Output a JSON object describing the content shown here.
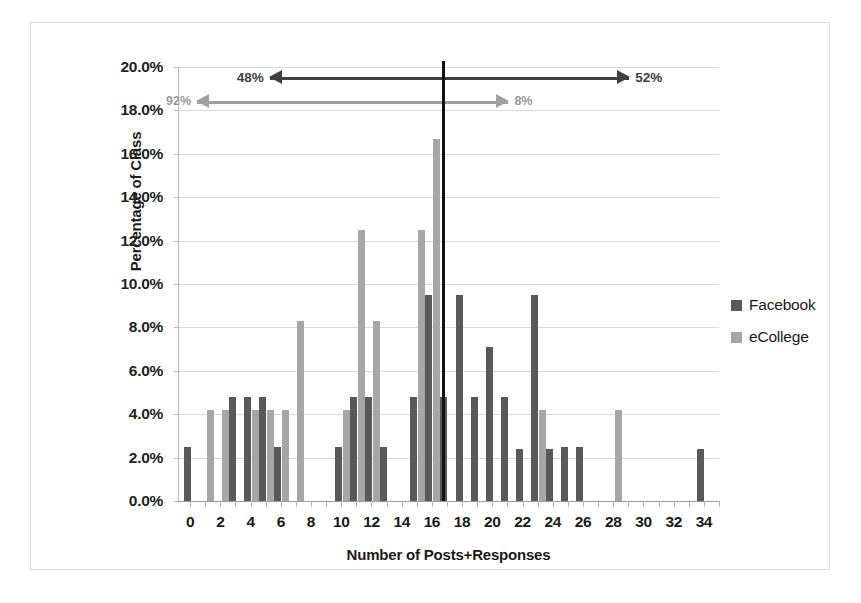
{
  "chart_data": {
    "type": "bar",
    "title": "",
    "xlabel": "Number of Posts+Responses",
    "ylabel": "Percentage of Class",
    "xlim": [
      -0.8,
      35
    ],
    "ylim": [
      0,
      20
    ],
    "ytick_labels": [
      "0.0%",
      "2.0%",
      "4.0%",
      "6.0%",
      "8.0%",
      "10.0%",
      "12.0%",
      "14.0%",
      "16.0%",
      "18.0%",
      "20.0%"
    ],
    "ytick_values": [
      0,
      2,
      4,
      6,
      8,
      10,
      12,
      14,
      16,
      18,
      20
    ],
    "xtick_labels": [
      "0",
      "2",
      "4",
      "6",
      "8",
      "10",
      "12",
      "14",
      "16",
      "18",
      "20",
      "22",
      "24",
      "26",
      "28",
      "30",
      "32",
      "34"
    ],
    "xtick_values": [
      0,
      2,
      4,
      6,
      8,
      10,
      12,
      14,
      16,
      18,
      20,
      22,
      24,
      26,
      28,
      30,
      32,
      34
    ],
    "grid": true,
    "legend_position": "right",
    "colors": {
      "facebook": "#595959",
      "ecollege": "#a6a6a6",
      "median_line": "#111111",
      "gridline": "#d9d9d9"
    },
    "series": [
      {
        "name": "Facebook",
        "color": "#595959",
        "points": [
          {
            "x": 0,
            "y": 2.5
          },
          {
            "x": 3,
            "y": 4.8
          },
          {
            "x": 4,
            "y": 4.8
          },
          {
            "x": 5,
            "y": 4.8
          },
          {
            "x": 6,
            "y": 2.5
          },
          {
            "x": 10,
            "y": 2.5
          },
          {
            "x": 11,
            "y": 4.8
          },
          {
            "x": 12,
            "y": 4.8
          },
          {
            "x": 13,
            "y": 2.5
          },
          {
            "x": 15,
            "y": 4.8
          },
          {
            "x": 16,
            "y": 9.5
          },
          {
            "x": 17,
            "y": 4.8
          },
          {
            "x": 18,
            "y": 9.5
          },
          {
            "x": 19,
            "y": 4.8
          },
          {
            "x": 20,
            "y": 7.1
          },
          {
            "x": 21,
            "y": 4.8
          },
          {
            "x": 22,
            "y": 2.4
          },
          {
            "x": 23,
            "y": 9.5
          },
          {
            "x": 24,
            "y": 2.4
          },
          {
            "x": 25,
            "y": 2.5
          },
          {
            "x": 26,
            "y": 2.5
          },
          {
            "x": 34,
            "y": 2.4
          }
        ]
      },
      {
        "name": "eCollege",
        "color": "#a6a6a6",
        "points": [
          {
            "x": 1,
            "y": 4.2
          },
          {
            "x": 2,
            "y": 4.2
          },
          {
            "x": 4,
            "y": 4.2
          },
          {
            "x": 5,
            "y": 4.2
          },
          {
            "x": 6,
            "y": 4.2
          },
          {
            "x": 7,
            "y": 8.3
          },
          {
            "x": 10,
            "y": 4.2
          },
          {
            "x": 11,
            "y": 12.5
          },
          {
            "x": 12,
            "y": 8.3
          },
          {
            "x": 15,
            "y": 12.5
          },
          {
            "x": 16,
            "y": 16.7
          },
          {
            "x": 23,
            "y": 4.2
          },
          {
            "x": 28,
            "y": 4.2
          }
        ]
      }
    ],
    "annotations": [
      {
        "id": "facebook-split",
        "left_label": "48%",
        "right_label": "52%",
        "x_from": 5.2,
        "x_to": 29.0,
        "pivot_x": 16.6,
        "y": 19.55,
        "style": "dark"
      },
      {
        "id": "ecollege-split",
        "left_label": "92%",
        "right_label": "8%",
        "x_from": 0.4,
        "x_to": 21.0,
        "pivot_x": 16.6,
        "y": 18.45,
        "style": "light"
      },
      {
        "id": "median-divider",
        "label": "",
        "x": 16.6,
        "style": "vertical-rule"
      }
    ]
  },
  "legend": {
    "items": [
      {
        "label": "Facebook",
        "color": "#595959"
      },
      {
        "label": "eCollege",
        "color": "#a6a6a6"
      }
    ]
  }
}
